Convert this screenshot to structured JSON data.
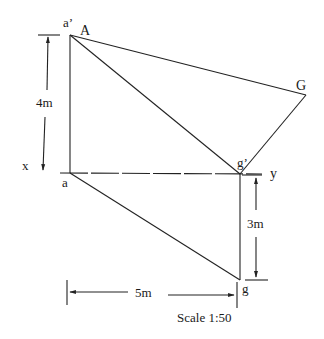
{
  "diagram": {
    "points": {
      "a_prime": {
        "label": "a’",
        "x": 70,
        "y": 35
      },
      "A": {
        "label": "A",
        "x": 70,
        "y": 35
      },
      "G": {
        "label": "G",
        "x": 306,
        "y": 95
      },
      "g_prime": {
        "label": "g’",
        "x": 240,
        "y": 173
      },
      "a": {
        "label": "a",
        "x": 70,
        "y": 173
      },
      "g": {
        "label": "g",
        "x": 240,
        "y": 280
      }
    },
    "reference_line": {
      "x_label": "x",
      "y_label": "y"
    },
    "dimensions": {
      "height_4m": "4m",
      "depth_3m": "3m",
      "width_5m": "5m"
    },
    "scale": "Scale 1:50"
  }
}
